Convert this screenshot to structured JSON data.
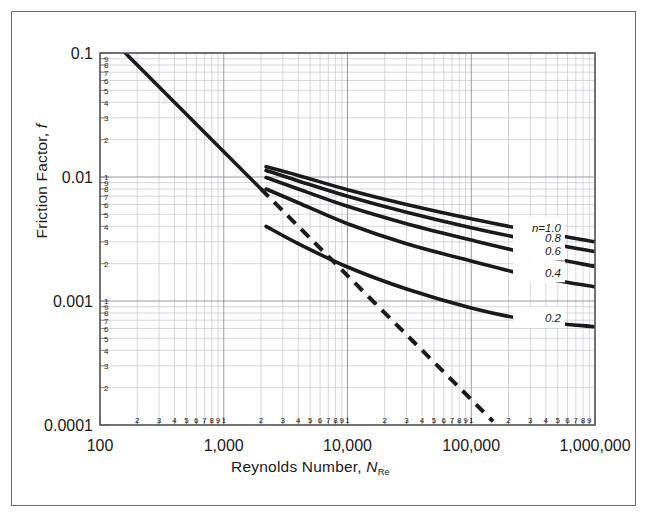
{
  "chart_data": {
    "type": "line",
    "title": "",
    "xlabel": "Reynolds Number, N_Re",
    "ylabel": "Friction Factor, f",
    "xscale": "log",
    "yscale": "log",
    "xlim": [
      100,
      1000000
    ],
    "ylim": [
      0.0001,
      0.1
    ],
    "grid": true,
    "legend_position": "inline-right",
    "x_major_ticks": [
      "100",
      "1,000",
      "10,000",
      "100,000",
      "1,000,000"
    ],
    "x_minor_ticks": [
      "2",
      "3",
      "4",
      "5",
      "6",
      "7",
      "8",
      "9",
      "1"
    ],
    "y_major_ticks": [
      "0.1",
      "0.01",
      "0.001",
      "0.0001"
    ],
    "y_minor_ticks": [
      "9",
      "8",
      "7",
      "6",
      "5",
      "4",
      "3",
      "2"
    ],
    "y_decade_top_tick": "1",
    "series": [
      {
        "name": "laminar",
        "style": "solid",
        "label": "",
        "points": [
          [
            150,
            0.1067
          ],
          [
            2000,
            0.008
          ]
        ]
      },
      {
        "name": "laminar-extension",
        "style": "dashed",
        "label": "",
        "points": [
          [
            2000,
            0.008
          ],
          [
            150000,
            0.000107
          ]
        ]
      },
      {
        "name": "n=1.0",
        "label": "n=1.0",
        "style": "solid",
        "points": [
          [
            2200,
            0.0121
          ],
          [
            4000,
            0.0103
          ],
          [
            10000,
            0.0079
          ],
          [
            30000,
            0.006
          ],
          [
            100000,
            0.0046
          ],
          [
            300000,
            0.0037
          ],
          [
            1000000,
            0.003
          ]
        ]
      },
      {
        "name": "n=0.8",
        "label": "0.8",
        "style": "solid",
        "points": [
          [
            2200,
            0.0113
          ],
          [
            4000,
            0.0093
          ],
          [
            10000,
            0.007
          ],
          [
            30000,
            0.0052
          ],
          [
            100000,
            0.0039
          ],
          [
            300000,
            0.0031
          ],
          [
            1000000,
            0.0025
          ]
        ]
      },
      {
        "name": "n=0.6",
        "label": "0.6",
        "style": "solid",
        "points": [
          [
            2200,
            0.0099
          ],
          [
            4000,
            0.008
          ],
          [
            10000,
            0.0058
          ],
          [
            30000,
            0.0042
          ],
          [
            100000,
            0.0031
          ],
          [
            300000,
            0.0024
          ],
          [
            1000000,
            0.0019
          ]
        ]
      },
      {
        "name": "n=0.4",
        "label": "0.4",
        "style": "solid",
        "points": [
          [
            2200,
            0.008
          ],
          [
            4000,
            0.0062
          ],
          [
            10000,
            0.0042
          ],
          [
            30000,
            0.0029
          ],
          [
            100000,
            0.0021
          ],
          [
            300000,
            0.0016
          ],
          [
            1000000,
            0.0013
          ]
        ]
      },
      {
        "name": "n=0.2",
        "label": "0.2",
        "style": "solid",
        "points": [
          [
            2200,
            0.004
          ],
          [
            4000,
            0.0029
          ],
          [
            10000,
            0.00188
          ],
          [
            30000,
            0.00125
          ],
          [
            100000,
            0.00088
          ],
          [
            300000,
            0.0007
          ],
          [
            1000000,
            0.00062
          ]
        ]
      }
    ],
    "colors": {
      "curve": "#1a1a1a",
      "grid_minor": "#c9c9cf",
      "grid_major": "#9a9aa2",
      "axis": "#4a4a50",
      "frame": "#6e6e72",
      "background": "#ffffff"
    }
  },
  "axis_titles": {
    "y_prefix": "Friction Factor, ",
    "y_symbol": "f",
    "x_prefix": "Reynolds Number, ",
    "x_symbol": "N",
    "x_symbol_sub": "Re"
  }
}
